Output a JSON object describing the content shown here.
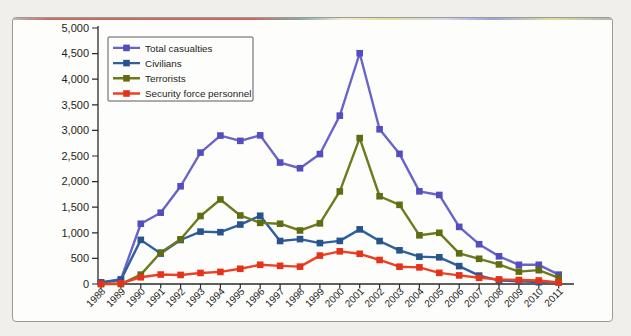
{
  "figure": {
    "kind": "scanned-book-figure",
    "colors": {
      "outer_background": "#f0efeb",
      "frame_background": "#fdfdfb",
      "frame_border": "#9b9b98",
      "axis": "#2b2b2b",
      "tick_text": "#1e1e1e",
      "legend_border": "#5a5a60",
      "legend_background": "#fdfdfb"
    }
  },
  "chart_data": {
    "type": "line",
    "title": "",
    "xlabel": "",
    "ylabel": "",
    "grid": false,
    "legend_position": "top-left",
    "marker": "square",
    "ylim": [
      0,
      5000
    ],
    "ytick_step": 500,
    "x": [
      1988,
      1989,
      1990,
      1991,
      1992,
      1993,
      1994,
      1995,
      1996,
      1997,
      1998,
      1999,
      2000,
      2001,
      2002,
      2003,
      2004,
      2005,
      2006,
      2007,
      2008,
      2009,
      2010,
      2011
    ],
    "series": [
      {
        "name": "Total casualties",
        "color": "#6965c8",
        "marker_color": "#534dbf",
        "values": [
          31,
          92,
          1177,
          1393,
          1909,
          2567,
          2899,
          2796,
          2903,
          2372,
          2261,
          2538,
          3288,
          4507,
          3022,
          2542,
          1810,
          1739,
          1116,
          777,
          541,
          375,
          375,
          183
        ]
      },
      {
        "name": "Civilians",
        "color": "#2e5fa0",
        "marker_color": "#28538d",
        "values": [
          29,
          79,
          862,
          594,
          859,
          1023,
          1012,
          1161,
          1333,
          840,
          877,
          799,
          842,
          1067,
          839,
          658,
          534,
          521,
          349,
          164,
          69,
          55,
          36,
          34
        ]
      },
      {
        "name": "Terrorists",
        "color": "#6e7a1d",
        "marker_color": "#606c12",
        "values": [
          1,
          0,
          183,
          614,
          873,
          1328,
          1651,
          1338,
          1194,
          1177,
          1045,
          1184,
          1808,
          2850,
          1714,
          1546,
          951,
          1000,
          599,
          492,
          382,
          242,
          270,
          119
        ]
      },
      {
        "name": "Security force personnel",
        "color": "#ec4126",
        "marker_color": "#e5331b",
        "values": [
          1,
          13,
          132,
          185,
          177,
          216,
          236,
          297,
          376,
          355,
          339,
          555,
          638,
          590,
          469,
          338,
          325,
          218,
          168,
          121,
          90,
          78,
          69,
          30
        ]
      }
    ]
  }
}
